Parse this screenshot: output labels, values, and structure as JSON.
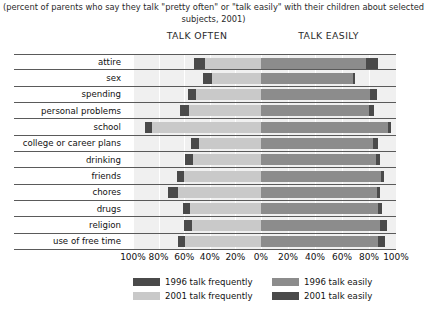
{
  "subtitle": "(percent of parents who say they talk \"pretty often\" or \"talk easily\" with their children about selected subjects, 2001)",
  "headers": {
    "left": "TALK OFTEN",
    "right": "TALK EASILY"
  },
  "axis": {
    "ticks": [
      "100%",
      "80%",
      "60%",
      "40%",
      "20%",
      "0%",
      "20%",
      "40%",
      "60%",
      "80%",
      "100%"
    ]
  },
  "legend": [
    {
      "label": "1996 talk frequently",
      "color": "#4a4a4a"
    },
    {
      "label": "2001 talk frequently",
      "color": "#c9c9c9"
    },
    {
      "label": "1996 talk easily",
      "color": "#8c8c8c"
    },
    {
      "label": "2001 talk easily",
      "color": "#4a4a4a"
    }
  ],
  "colors": {
    "talk_frequently_1996": "#4a4a4a",
    "talk_frequently_2001": "#c9c9c9",
    "talk_easily_1996": "#8c8c8c",
    "talk_easily_2001": "#4a4a4a",
    "band_background": "#f0f0f0",
    "rule": "#5a5a5a"
  },
  "chart_data": {
    "type": "bar",
    "title": "",
    "subtitle": "(percent of parents who say they talk \"pretty often\" or \"talk easily\" with their children about selected subjects, 2001)",
    "orientation": "horizontal-diverging",
    "xlabel": "",
    "ylabel": "",
    "grid": true,
    "legend_position": "bottom",
    "left_panel": {
      "label": "TALK OFTEN",
      "axis_direction": "right-to-left",
      "xlim": [
        0,
        100
      ]
    },
    "right_panel": {
      "label": "TALK EASILY",
      "axis_direction": "left-to-right",
      "xlim": [
        0,
        100
      ]
    },
    "categories": [
      "attire",
      "sex",
      "spending",
      "personal problems",
      "school",
      "college or career plans",
      "drinking",
      "friends",
      "chores",
      "drugs",
      "religion",
      "use of free time"
    ],
    "series": [
      {
        "name": "1996 talk frequently",
        "panel": "left",
        "color": "#4a4a4a",
        "values": [
          52,
          45,
          57,
          63,
          91,
          55,
          59,
          66,
          73,
          61,
          60,
          65
        ]
      },
      {
        "name": "2001 talk frequently",
        "panel": "left",
        "color": "#c9c9c9",
        "values": [
          48,
          42,
          55,
          60,
          89,
          52,
          57,
          64,
          69,
          59,
          58,
          63
        ]
      },
      {
        "name": "1996 talk easily",
        "panel": "right",
        "color": "#8c8c8c",
        "values": [
          78,
          68,
          81,
          80,
          94,
          83,
          85,
          89,
          86,
          87,
          88,
          87
        ]
      },
      {
        "name": "2001 talk easily",
        "panel": "right",
        "color": "#4a4a4a",
        "values": [
          87,
          69,
          86,
          84,
          96,
          87,
          88,
          91,
          88,
          90,
          93,
          92
        ]
      }
    ]
  }
}
